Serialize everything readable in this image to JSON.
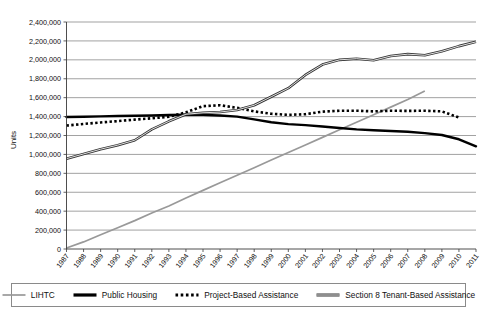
{
  "chart_data": {
    "type": "line",
    "title": "",
    "xlabel": "",
    "ylabel": "Units",
    "x": [
      1987,
      1988,
      1989,
      1990,
      1991,
      1992,
      1993,
      1994,
      1995,
      1996,
      1997,
      1998,
      1999,
      2000,
      2001,
      2002,
      2003,
      2004,
      2005,
      2006,
      2007,
      2008,
      2009,
      2010,
      2011
    ],
    "xtick_labels": [
      "1987",
      "1988",
      "1989",
      "1990",
      "1991",
      "1992",
      "1993",
      "1994",
      "1995",
      "1996",
      "1997",
      "1998",
      "1999",
      "2000",
      "2001",
      "2002",
      "2003",
      "2004",
      "2005",
      "2006",
      "2007",
      "2008",
      "2009",
      "2010",
      "2011"
    ],
    "ytick_labels": [
      "0",
      "200,000",
      "400,000",
      "600,000",
      "800,000",
      "1,000,000",
      "1,200,000",
      "1,400,000",
      "1,600,000",
      "1,800,000",
      "2,000,000",
      "2,200,000",
      "2,400,000"
    ],
    "ytick_values": [
      0,
      200000,
      400000,
      600000,
      800000,
      1000000,
      1200000,
      1400000,
      1600000,
      1800000,
      2000000,
      2200000,
      2400000
    ],
    "ylim": [
      0,
      2400000
    ],
    "xlim": [
      1987,
      2011
    ],
    "grid": true,
    "legend_position": "bottom",
    "series": [
      {
        "name": "LIHTC",
        "style": "solid-thin-gray",
        "color": "#999999",
        "x": [
          1987,
          1988,
          1989,
          1990,
          1991,
          1992,
          1993,
          1994,
          1995,
          1996,
          1997,
          1998,
          1999,
          2000,
          2001,
          2002,
          2003,
          2004,
          2005,
          2006,
          2007,
          2008
        ],
        "values": [
          10000,
          75000,
          150000,
          225000,
          300000,
          380000,
          455000,
          540000,
          620000,
          700000,
          780000,
          860000,
          940000,
          1020000,
          1100000,
          1180000,
          1260000,
          1340000,
          1420000,
          1500000,
          1580000,
          1670000
        ]
      },
      {
        "name": "Public Housing",
        "style": "solid-thick-black",
        "color": "#000000",
        "x": [
          1987,
          1988,
          1989,
          1990,
          1991,
          1992,
          1993,
          1994,
          1995,
          1996,
          1997,
          1998,
          1999,
          2000,
          2001,
          2002,
          2003,
          2004,
          2005,
          2006,
          2007,
          2008,
          2009,
          2010,
          2011
        ],
        "values": [
          1395000,
          1398000,
          1402000,
          1406000,
          1409000,
          1412000,
          1416000,
          1420000,
          1418000,
          1412000,
          1400000,
          1370000,
          1340000,
          1320000,
          1310000,
          1295000,
          1280000,
          1265000,
          1255000,
          1248000,
          1240000,
          1225000,
          1205000,
          1160000,
          1085000
        ]
      },
      {
        "name": "Project-Based Assistance",
        "style": "dotted-black",
        "color": "#000000",
        "x": [
          1987,
          1988,
          1989,
          1990,
          1991,
          1992,
          1993,
          1994,
          1995,
          1996,
          1997,
          1998,
          1999,
          2000,
          2001,
          2002,
          2003,
          2004,
          2005,
          2006,
          2007,
          2008,
          2009,
          2010
        ],
        "values": [
          1305000,
          1322000,
          1338000,
          1352000,
          1368000,
          1382000,
          1398000,
          1445000,
          1510000,
          1520000,
          1492000,
          1455000,
          1430000,
          1418000,
          1425000,
          1452000,
          1462000,
          1462000,
          1455000,
          1462000,
          1460000,
          1462000,
          1455000,
          1390000
        ]
      },
      {
        "name": "Section 8 Tenant-Based Assistance",
        "style": "solid-double-thin",
        "color": "#333333",
        "x": [
          1987,
          1988,
          1989,
          1990,
          1991,
          1992,
          1993,
          1994,
          1995,
          1996,
          1997,
          1998,
          1999,
          2000,
          2001,
          2002,
          2003,
          2004,
          2005,
          2006,
          2007,
          2008,
          2009,
          2010,
          2011
        ],
        "values": [
          955000,
          1005000,
          1055000,
          1098000,
          1150000,
          1265000,
          1350000,
          1425000,
          1440000,
          1448000,
          1470000,
          1520000,
          1610000,
          1700000,
          1840000,
          1950000,
          2000000,
          2012000,
          1995000,
          2040000,
          2060000,
          2048000,
          2090000,
          2145000,
          2190000
        ]
      }
    ]
  },
  "legend": {
    "items": [
      {
        "label": "LIHTC",
        "swatch": "swatch-thin-gray"
      },
      {
        "label": "Public Housing",
        "swatch": "swatch-thick-black"
      },
      {
        "label": "Project-Based Assistance",
        "swatch": "swatch-dotted"
      },
      {
        "label": "Section 8 Tenant-Based Assistance",
        "swatch": "swatch-double-gray"
      }
    ]
  }
}
